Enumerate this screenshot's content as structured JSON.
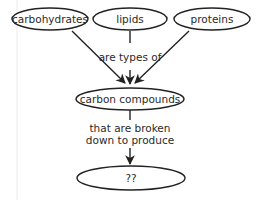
{
  "diagram": {
    "type": "concept-map",
    "nodes": {
      "carbohydrates": "carbohydrates",
      "lipids": "lipids",
      "proteins": "proteins",
      "carbon_compounds": "carbon compounds",
      "unknown": "??"
    },
    "links": {
      "types_of": "are types of",
      "broken_down_line1": "that are broken",
      "broken_down_line2": "down to produce"
    },
    "edges": [
      {
        "from": "carbohydrates",
        "to": "carbon compounds"
      },
      {
        "from": "lipids",
        "to": "carbon compounds",
        "label": "are types of"
      },
      {
        "from": "proteins",
        "to": "carbon compounds"
      },
      {
        "from": "carbon compounds",
        "to": "??",
        "label": "that are broken down to produce"
      }
    ],
    "colors": {
      "stroke": "#222222",
      "text": "#2a2a2a",
      "background": "#ffffff"
    }
  }
}
